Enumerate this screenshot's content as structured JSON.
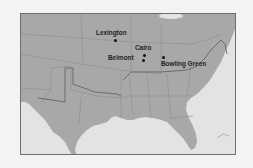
{
  "map": {
    "region": "Southern and Central United States",
    "colors": {
      "land": "#a8a8a8",
      "water": "#e3e3e3",
      "border_lines": "#8a8a8a",
      "highlight_line": "#5a5a5a",
      "frame": "#6e6e6e",
      "background": "#f3f3f3",
      "label": "#1e1e1e"
    },
    "cities": [
      {
        "name": "Lexington",
        "dot_x": 95,
        "dot_y": 38,
        "label_x": 75,
        "label_y": 29
      },
      {
        "name": "Cairo",
        "dot_x": 143,
        "dot_y": 53,
        "label_x": 134,
        "label_y": 44
      },
      {
        "name": "Belmont",
        "dot_x": 141,
        "dot_y": 58,
        "label_x": 107,
        "label_y": 54
      },
      {
        "name": "Bowling Green",
        "dot_x": 162,
        "dot_y": 55,
        "label_x": 160,
        "label_y": 60
      }
    ]
  }
}
